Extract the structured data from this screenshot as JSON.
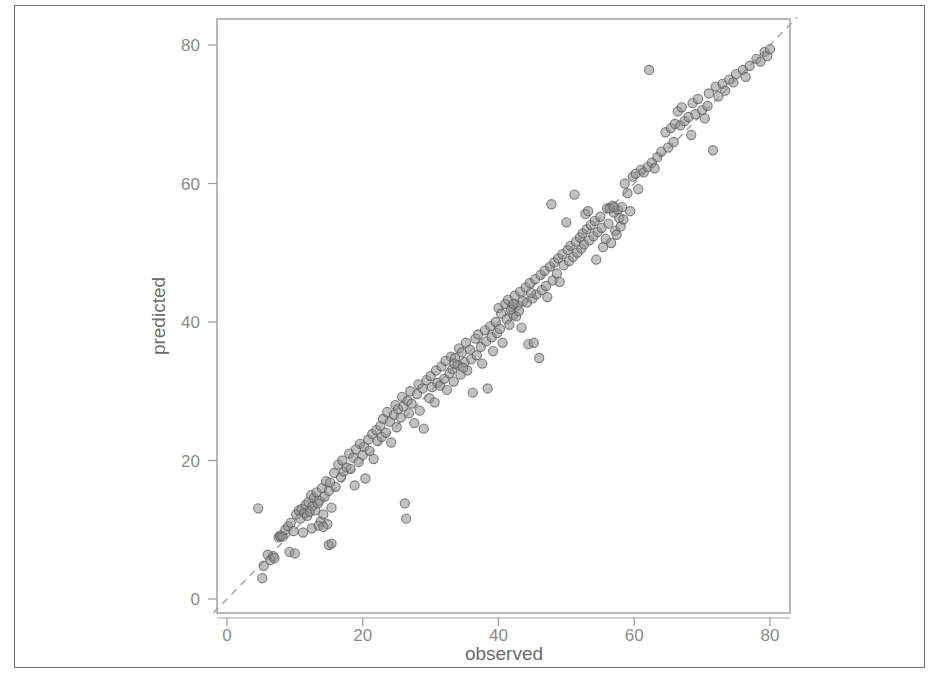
{
  "figure": {
    "name": "observed-vs-predicted-scatter",
    "background_color": "#ffffff",
    "frame_color": "#6e6e6e",
    "panel_border_color": "#9a9a9a"
  },
  "chart_data": {
    "type": "scatter",
    "title": "",
    "xlabel": "observed",
    "ylabel": "predicted",
    "xlim": [
      -2,
      84
    ],
    "ylim": [
      -3,
      84
    ],
    "xticks": [
      0,
      20,
      40,
      60,
      80
    ],
    "yticks": [
      0,
      20,
      40,
      60,
      80
    ],
    "xtick_labels": [
      "0",
      "20",
      "40",
      "60",
      "80"
    ],
    "ytick_labels": [
      "0",
      "20",
      "40",
      "60",
      "80"
    ],
    "grid": false,
    "legend": null,
    "point_color": "#8e8e8e",
    "point_edge_color": "#5c5c5c",
    "point_opacity": 0.55,
    "point_radius": 4.6,
    "reference_line": {
      "name": "identity-line",
      "style": "dashed",
      "color": "#a8a8a8",
      "from": [
        -2,
        -2
      ],
      "to": [
        84,
        84
      ],
      "equation": "y = x"
    },
    "n_points": 258,
    "points": [
      [
        4.6,
        13.1
      ],
      [
        5.2,
        3.0
      ],
      [
        5.4,
        4.8
      ],
      [
        6.0,
        6.4
      ],
      [
        6.4,
        5.6
      ],
      [
        6.8,
        6.2
      ],
      [
        7.0,
        5.9
      ],
      [
        7.6,
        8.9
      ],
      [
        7.8,
        9.1
      ],
      [
        8.0,
        9.2
      ],
      [
        8.2,
        9.0
      ],
      [
        8.6,
        10.0
      ],
      [
        9.0,
        10.5
      ],
      [
        9.4,
        11.0
      ],
      [
        9.8,
        9.8
      ],
      [
        10.2,
        12.2
      ],
      [
        10.6,
        12.8
      ],
      [
        10.8,
        11.6
      ],
      [
        11.0,
        13.0
      ],
      [
        11.2,
        9.6
      ],
      [
        11.4,
        12.4
      ],
      [
        11.6,
        13.6
      ],
      [
        11.8,
        12.0
      ],
      [
        12.0,
        14.0
      ],
      [
        12.2,
        12.6
      ],
      [
        12.4,
        15.0
      ],
      [
        12.6,
        13.4
      ],
      [
        12.8,
        14.6
      ],
      [
        13.0,
        12.8
      ],
      [
        13.2,
        15.4
      ],
      [
        13.4,
        13.8
      ],
      [
        13.6,
        14.2
      ],
      [
        13.8,
        11.2
      ],
      [
        14.0,
        16.0
      ],
      [
        14.2,
        12.2
      ],
      [
        14.4,
        14.8
      ],
      [
        14.6,
        17.0
      ],
      [
        14.8,
        10.8
      ],
      [
        15.0,
        15.6
      ],
      [
        15.2,
        16.8
      ],
      [
        15.4,
        13.2
      ],
      [
        15.8,
        18.2
      ],
      [
        16.0,
        16.2
      ],
      [
        16.4,
        19.4
      ],
      [
        16.8,
        17.6
      ],
      [
        17.0,
        20.0
      ],
      [
        17.2,
        18.4
      ],
      [
        17.6,
        19.0
      ],
      [
        18.0,
        21.0
      ],
      [
        18.2,
        18.8
      ],
      [
        18.6,
        20.4
      ],
      [
        18.8,
        16.4
      ],
      [
        19.0,
        21.6
      ],
      [
        19.4,
        19.8
      ],
      [
        19.6,
        22.4
      ],
      [
        20.0,
        20.8
      ],
      [
        20.2,
        22.0
      ],
      [
        20.4,
        17.4
      ],
      [
        20.8,
        23.0
      ],
      [
        21.0,
        21.4
      ],
      [
        21.4,
        23.8
      ],
      [
        21.6,
        20.2
      ],
      [
        22.0,
        24.4
      ],
      [
        22.2,
        22.8
      ],
      [
        22.6,
        25.0
      ],
      [
        22.8,
        23.4
      ],
      [
        23.0,
        26.0
      ],
      [
        23.4,
        24.0
      ],
      [
        23.6,
        27.0
      ],
      [
        24.0,
        25.6
      ],
      [
        24.2,
        22.6
      ],
      [
        24.6,
        26.6
      ],
      [
        24.8,
        28.0
      ],
      [
        25.0,
        24.8
      ],
      [
        25.2,
        27.4
      ],
      [
        25.6,
        26.2
      ],
      [
        25.8,
        29.2
      ],
      [
        26.0,
        27.8
      ],
      [
        26.2,
        13.8
      ],
      [
        26.4,
        11.6
      ],
      [
        26.6,
        28.6
      ],
      [
        26.8,
        26.8
      ],
      [
        27.0,
        30.0
      ],
      [
        27.2,
        28.2
      ],
      [
        27.6,
        25.4
      ],
      [
        28.0,
        29.6
      ],
      [
        28.2,
        31.0
      ],
      [
        28.4,
        27.2
      ],
      [
        28.8,
        30.4
      ],
      [
        29.0,
        24.6
      ],
      [
        29.4,
        31.6
      ],
      [
        29.8,
        29.0
      ],
      [
        30.0,
        32.2
      ],
      [
        30.2,
        30.6
      ],
      [
        30.6,
        28.4
      ],
      [
        30.8,
        33.0
      ],
      [
        31.0,
        31.2
      ],
      [
        31.4,
        30.8
      ],
      [
        31.6,
        33.6
      ],
      [
        32.0,
        31.8
      ],
      [
        32.2,
        34.4
      ],
      [
        32.4,
        30.2
      ],
      [
        32.8,
        32.6
      ],
      [
        33.0,
        35.0
      ],
      [
        33.2,
        33.2
      ],
      [
        33.4,
        31.4
      ],
      [
        33.6,
        34.8
      ],
      [
        34.0,
        33.8
      ],
      [
        34.2,
        36.2
      ],
      [
        34.4,
        32.4
      ],
      [
        34.6,
        35.6
      ],
      [
        35.0,
        34.2
      ],
      [
        35.2,
        37.0
      ],
      [
        35.4,
        33.0
      ],
      [
        35.8,
        36.0
      ],
      [
        36.0,
        34.6
      ],
      [
        36.2,
        29.8
      ],
      [
        36.6,
        37.6
      ],
      [
        36.8,
        35.2
      ],
      [
        37.0,
        38.2
      ],
      [
        37.4,
        36.4
      ],
      [
        37.6,
        34.0
      ],
      [
        38.0,
        38.8
      ],
      [
        38.2,
        37.2
      ],
      [
        38.4,
        30.4
      ],
      [
        38.8,
        39.4
      ],
      [
        39.0,
        37.8
      ],
      [
        39.2,
        35.8
      ],
      [
        39.6,
        40.0
      ],
      [
        39.8,
        38.4
      ],
      [
        40.0,
        42.0
      ],
      [
        40.2,
        39.0
      ],
      [
        40.4,
        41.2
      ],
      [
        40.6,
        37.0
      ],
      [
        41.0,
        42.6
      ],
      [
        41.2,
        40.4
      ],
      [
        41.4,
        43.2
      ],
      [
        41.6,
        39.6
      ],
      [
        42.0,
        42.2
      ],
      [
        42.2,
        41.0
      ],
      [
        42.4,
        43.8
      ],
      [
        42.6,
        40.8
      ],
      [
        42.8,
        42.4
      ],
      [
        43.0,
        41.6
      ],
      [
        43.2,
        44.4
      ],
      [
        43.4,
        39.2
      ],
      [
        43.6,
        43.0
      ],
      [
        44.0,
        45.0
      ],
      [
        44.2,
        42.8
      ],
      [
        44.4,
        36.8
      ],
      [
        44.6,
        45.6
      ],
      [
        45.0,
        43.4
      ],
      [
        45.2,
        37.0
      ],
      [
        45.4,
        46.2
      ],
      [
        45.6,
        44.0
      ],
      [
        46.0,
        34.8
      ],
      [
        46.2,
        46.8
      ],
      [
        46.4,
        44.6
      ],
      [
        46.8,
        47.4
      ],
      [
        47.0,
        45.2
      ],
      [
        47.2,
        43.6
      ],
      [
        47.6,
        48.0
      ],
      [
        47.8,
        57.0
      ],
      [
        48.0,
        46.0
      ],
      [
        48.2,
        48.6
      ],
      [
        48.6,
        47.0
      ],
      [
        48.8,
        49.2
      ],
      [
        49.0,
        45.8
      ],
      [
        49.4,
        49.8
      ],
      [
        49.6,
        48.2
      ],
      [
        50.0,
        54.4
      ],
      [
        50.2,
        50.4
      ],
      [
        50.4,
        48.8
      ],
      [
        50.6,
        51.0
      ],
      [
        51.0,
        49.4
      ],
      [
        51.2,
        58.4
      ],
      [
        51.4,
        51.6
      ],
      [
        51.6,
        50.0
      ],
      [
        52.0,
        52.2
      ],
      [
        52.2,
        50.6
      ],
      [
        52.4,
        52.8
      ],
      [
        52.6,
        51.2
      ],
      [
        52.8,
        55.6
      ],
      [
        53.0,
        53.4
      ],
      [
        53.2,
        56.0
      ],
      [
        53.4,
        51.8
      ],
      [
        53.6,
        54.0
      ],
      [
        54.0,
        52.4
      ],
      [
        54.2,
        54.6
      ],
      [
        54.4,
        49.0
      ],
      [
        54.6,
        53.0
      ],
      [
        55.0,
        55.2
      ],
      [
        55.2,
        53.6
      ],
      [
        55.4,
        50.8
      ],
      [
        55.8,
        52.0
      ],
      [
        56.0,
        56.4
      ],
      [
        56.2,
        54.2
      ],
      [
        56.6,
        51.4
      ],
      [
        56.8,
        56.8
      ],
      [
        57.0,
        55.8
      ],
      [
        57.2,
        53.2
      ],
      [
        57.4,
        52.6
      ],
      [
        57.6,
        56.2
      ],
      [
        57.8,
        55.0
      ],
      [
        58.0,
        53.8
      ],
      [
        58.2,
        56.6
      ],
      [
        58.4,
        54.8
      ],
      [
        58.6,
        60.0
      ],
      [
        59.0,
        58.6
      ],
      [
        59.4,
        56.0
      ],
      [
        59.8,
        61.0
      ],
      [
        60.2,
        61.4
      ],
      [
        60.6,
        59.2
      ],
      [
        61.0,
        62.0
      ],
      [
        61.4,
        61.6
      ],
      [
        62.0,
        62.4
      ],
      [
        62.2,
        76.4
      ],
      [
        62.6,
        63.0
      ],
      [
        63.0,
        62.2
      ],
      [
        63.4,
        63.8
      ],
      [
        64.0,
        64.6
      ],
      [
        64.6,
        67.4
      ],
      [
        65.0,
        65.2
      ],
      [
        65.4,
        68.0
      ],
      [
        65.8,
        66.0
      ],
      [
        66.0,
        68.6
      ],
      [
        66.4,
        70.4
      ],
      [
        66.8,
        68.4
      ],
      [
        67.0,
        71.0
      ],
      [
        67.4,
        69.0
      ],
      [
        68.0,
        69.6
      ],
      [
        68.4,
        67.0
      ],
      [
        68.6,
        71.6
      ],
      [
        69.0,
        70.0
      ],
      [
        69.4,
        72.2
      ],
      [
        70.0,
        70.6
      ],
      [
        70.4,
        69.4
      ],
      [
        70.8,
        71.2
      ],
      [
        71.0,
        73.0
      ],
      [
        71.6,
        64.8
      ],
      [
        72.0,
        74.0
      ],
      [
        72.4,
        72.6
      ],
      [
        73.0,
        74.4
      ],
      [
        73.4,
        73.4
      ],
      [
        74.0,
        75.0
      ],
      [
        74.6,
        74.6
      ],
      [
        75.0,
        75.8
      ],
      [
        76.0,
        76.4
      ],
      [
        76.4,
        75.4
      ],
      [
        77.0,
        77.0
      ],
      [
        78.0,
        78.0
      ],
      [
        78.6,
        77.6
      ],
      [
        79.2,
        79.0
      ],
      [
        79.6,
        78.4
      ],
      [
        80.0,
        79.4
      ],
      [
        12.5,
        10.2
      ],
      [
        13.5,
        10.6
      ],
      [
        14.2,
        10.4
      ],
      [
        15.0,
        7.8
      ],
      [
        15.4,
        8.0
      ],
      [
        9.2,
        6.8
      ],
      [
        10.0,
        6.6
      ],
      [
        33.5,
        34.0
      ],
      [
        34.8,
        33.4
      ],
      [
        41.8,
        41.8
      ],
      [
        42.2,
        42.6
      ],
      [
        56.4,
        56.4
      ],
      [
        57.0,
        56.6
      ],
      [
        44.8,
        44.2
      ]
    ]
  }
}
